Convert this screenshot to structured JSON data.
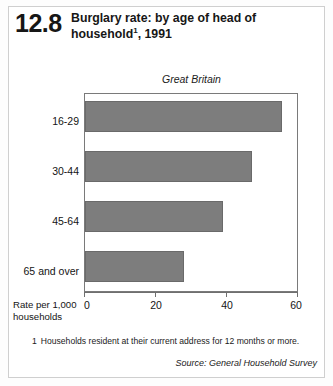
{
  "header": {
    "number": "12.8",
    "title_line1": "Burglary rate: by age of head of",
    "title_line2_pre": "household",
    "title_footnote_marker": "1",
    "title_line2_post": ", 1991"
  },
  "footnote": {
    "marker": "1",
    "text": "Households resident at their current address for 12 months or more."
  },
  "source": "Source: General Household Survey",
  "axis": {
    "y_title_line1": "Rate per 1,000",
    "y_title_line2": "households"
  },
  "colors": {
    "bar_fill": "#7d7d7d",
    "bar_stroke": "#6a6a6a",
    "frame": "#7a7a7a",
    "text": "#141414"
  },
  "chart_data": {
    "type": "bar",
    "orientation": "horizontal",
    "subtitle": "Great Britain",
    "categories": [
      "16-29",
      "30-44",
      "45-64",
      "65 and over"
    ],
    "values": [
      55.5,
      47,
      39,
      28
    ],
    "xlabel": "Rate per 1,000 households",
    "ylabel": "",
    "xlim": [
      0,
      60
    ],
    "xticks": [
      0,
      20,
      40,
      60
    ],
    "xtick_labels": [
      "0",
      "20",
      "40",
      "60"
    ],
    "grid": false,
    "legend": false,
    "series": [
      {
        "name": "Burglary rate per 1,000 households",
        "values": [
          55.5,
          47,
          39,
          28
        ]
      }
    ]
  }
}
